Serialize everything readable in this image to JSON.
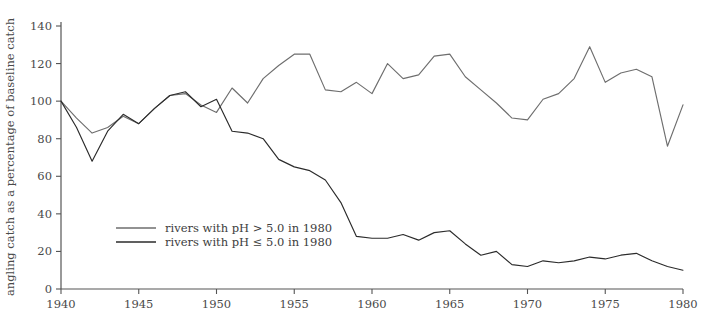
{
  "chart_data": {
    "type": "line",
    "title": "",
    "xlabel": "",
    "ylabel": "angling catch as a percentage of baseline catch",
    "xlim": [
      1940,
      1980
    ],
    "ylim": [
      0,
      140
    ],
    "xticks": [
      1940,
      1945,
      1950,
      1955,
      1960,
      1965,
      1970,
      1975,
      1980
    ],
    "yticks": [
      0,
      20,
      40,
      60,
      80,
      100,
      120,
      140
    ],
    "grid": false,
    "legend_position": "inside-left-lower",
    "x": [
      1940,
      1941,
      1942,
      1943,
      1944,
      1945,
      1946,
      1947,
      1948,
      1949,
      1950,
      1951,
      1952,
      1953,
      1954,
      1955,
      1956,
      1957,
      1958,
      1959,
      1960,
      1961,
      1962,
      1963,
      1964,
      1965,
      1966,
      1967,
      1968,
      1969,
      1970,
      1971,
      1972,
      1973,
      1974,
      1975,
      1976,
      1977,
      1978,
      1979,
      1980
    ],
    "series": [
      {
        "name": "rivers with pH > 5.0 in 1980",
        "color": "#6e6e6e",
        "values": [
          100,
          91,
          83,
          86,
          92,
          88,
          96,
          103,
          104,
          98,
          94,
          107,
          99,
          112,
          119,
          125,
          125,
          106,
          105,
          110,
          104,
          120,
          112,
          114,
          124,
          125,
          113,
          106,
          99,
          91,
          90,
          101,
          104,
          112,
          129,
          110,
          115,
          117,
          113,
          76,
          98
        ]
      },
      {
        "name": "rivers with pH ≤ 5.0 in 1980",
        "color": "#2b2b2b",
        "values": [
          100,
          86,
          68,
          84,
          93,
          88,
          96,
          103,
          105,
          97,
          101,
          84,
          83,
          80,
          69,
          65,
          63,
          58,
          46,
          28,
          27,
          27,
          29,
          26,
          30,
          31,
          24,
          18,
          20,
          13,
          12,
          15,
          14,
          15,
          17,
          16,
          18,
          19,
          15,
          12,
          10
        ]
      }
    ],
    "legend": [
      {
        "label": "rivers with pH > 5.0 in 1980",
        "color": "#6e6e6e"
      },
      {
        "label": "rivers with pH ≤ 5.0 in 1980",
        "color": "#2b2b2b"
      }
    ]
  },
  "axes": {
    "y_axis_title": "angling catch as a percentage of baseline catch",
    "y_labels": [
      "140",
      "120",
      "100",
      "80",
      "60",
      "40",
      "20",
      "0"
    ],
    "x_labels": [
      "1940",
      "1945",
      "1950",
      "1955",
      "1960",
      "1965",
      "1970",
      "1975",
      "1980"
    ]
  },
  "legend": {
    "item_high_label": "rivers with pH > 5.0 in 1980",
    "item_low_label": "rivers with pH ≤ 5.0 in 1980"
  },
  "colors": {
    "series_high": "#6e6e6e",
    "series_low": "#2b2b2b",
    "axis": "#555555",
    "text": "#4a4a4a",
    "background": "#ffffff"
  }
}
